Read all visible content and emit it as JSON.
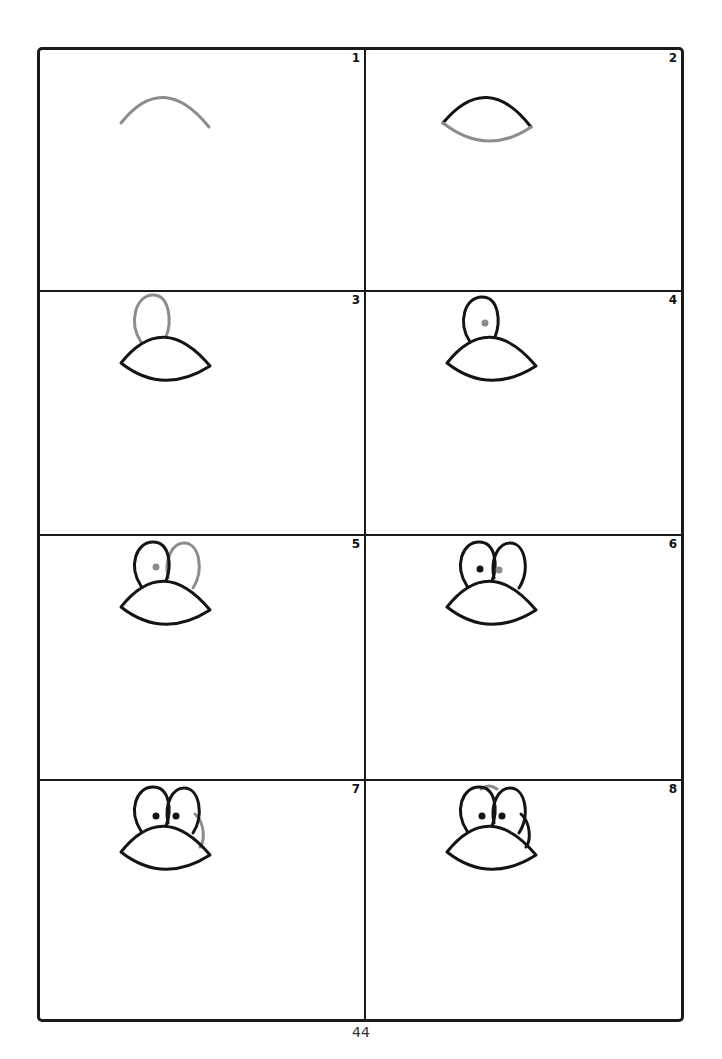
{
  "page": {
    "page_number": "44",
    "colors": {
      "ink": "#141414",
      "new_stroke": "#8c8c8c",
      "background": "#ffffff"
    }
  },
  "steps": [
    {
      "number": "1",
      "description": "Draw an upward arc (top of mouth)"
    },
    {
      "number": "2",
      "description": "Close the shape with a lower curve to form a lens"
    },
    {
      "number": "3",
      "description": "Add an oval for the left eye on top"
    },
    {
      "number": "4",
      "description": "Add a pupil dot inside the left eye"
    },
    {
      "number": "5",
      "description": "Add an oval for the right eye"
    },
    {
      "number": "6",
      "description": "Add a pupil dot inside the right eye"
    },
    {
      "number": "7",
      "description": "Add a curve on the right side behind the eye"
    },
    {
      "number": "8",
      "description": "Add a small curve on top between the eyes"
    }
  ]
}
